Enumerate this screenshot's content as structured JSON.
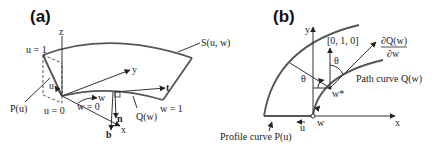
{
  "panels": {
    "a": {
      "label": "(a)",
      "surface": "S(u, w)",
      "u1": "u = 1",
      "u0": "u = 0",
      "w0": "w = 0",
      "w1": "w = 1",
      "profile": "P(u)",
      "path": "Q(w)",
      "axis_x": "x",
      "axis_y": "y",
      "axis_z": "z",
      "vec_u": "u",
      "vec_w": "w",
      "vec_t": "t",
      "vec_n": "n",
      "vec_b": "b"
    },
    "b": {
      "label": "(b)",
      "axis_x": "x",
      "axis_y": "y",
      "up_vector": "[0, 1, 0]",
      "deriv_num": "∂Q(w)",
      "deriv_den": "∂w",
      "theta": "θ",
      "wstar": "w*",
      "vec_u": "u",
      "vec_w": "w",
      "path_curve": "Path curve Q(w)",
      "profile_curve": "Profile curve P(u)"
    }
  }
}
